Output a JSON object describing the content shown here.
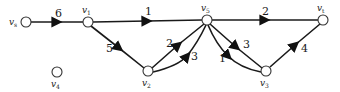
{
  "graph": {
    "title": "Directed weighted network",
    "nodes": [
      {
        "id": "vs",
        "label": "v",
        "sub": "s",
        "x": 26,
        "y": 22,
        "label_pos": "left"
      },
      {
        "id": "v1",
        "label": "v",
        "sub": "1",
        "x": 88,
        "y": 22,
        "label_pos": "top"
      },
      {
        "id": "v5",
        "label": "v",
        "sub": "5",
        "x": 207,
        "y": 20,
        "label_pos": "top"
      },
      {
        "id": "vt",
        "label": "v",
        "sub": "t",
        "x": 323,
        "y": 20,
        "label_pos": "top"
      },
      {
        "id": "v2",
        "label": "v",
        "sub": "2",
        "x": 148,
        "y": 71,
        "label_pos": "bottom"
      },
      {
        "id": "v3",
        "label": "v",
        "sub": "3",
        "x": 266,
        "y": 71,
        "label_pos": "bottom"
      },
      {
        "id": "v4",
        "label": "v",
        "sub": "4",
        "x": 57,
        "y": 72,
        "label_pos": "bottom"
      }
    ],
    "edges": [
      {
        "from": "vs",
        "to": "v1",
        "weight": "6"
      },
      {
        "from": "v1",
        "to": "v5",
        "weight": "1"
      },
      {
        "from": "v5",
        "to": "vt",
        "weight": "2"
      },
      {
        "from": "v1",
        "to": "v2",
        "weight": "5"
      },
      {
        "from": "v2",
        "to": "v5",
        "weight": "2",
        "shape": "straight"
      },
      {
        "from": "v2",
        "to": "v5",
        "weight": "3",
        "shape": "curved"
      },
      {
        "from": "v5",
        "to": "v3",
        "weight": "3",
        "shape": "straight"
      },
      {
        "from": "v5",
        "to": "v3",
        "weight": "1",
        "shape": "curved"
      },
      {
        "from": "v3",
        "to": "vt",
        "weight": "4"
      }
    ]
  }
}
